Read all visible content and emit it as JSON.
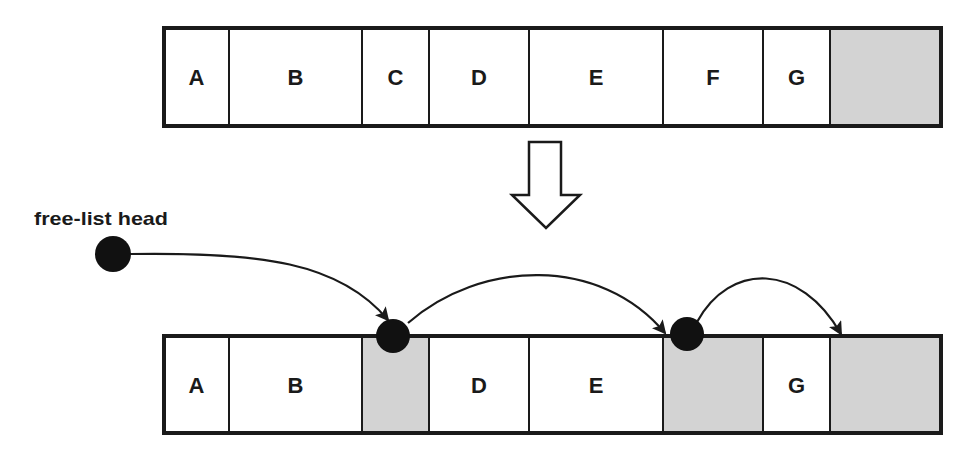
{
  "colors": {
    "stroke": "#1a1a1a",
    "free_fill": "#d3d3d3",
    "used_fill": "#ffffff",
    "node": "#111111"
  },
  "before": {
    "blocks": [
      {
        "label": "A",
        "x": 164,
        "w": 65,
        "free": false
      },
      {
        "label": "B",
        "x": 229,
        "w": 133,
        "free": false
      },
      {
        "label": "C",
        "x": 362,
        "w": 67,
        "free": false
      },
      {
        "label": "D",
        "x": 429,
        "w": 100,
        "free": false
      },
      {
        "label": "E",
        "x": 529,
        "w": 134,
        "free": false
      },
      {
        "label": "F",
        "x": 663,
        "w": 100,
        "free": false
      },
      {
        "label": "G",
        "x": 763,
        "w": 67,
        "free": false
      },
      {
        "label": "",
        "x": 830,
        "w": 111,
        "free": true
      }
    ]
  },
  "after": {
    "blocks": [
      {
        "label": "A",
        "x": 164,
        "w": 65,
        "free": false
      },
      {
        "label": "B",
        "x": 229,
        "w": 133,
        "free": false
      },
      {
        "label": "",
        "x": 362,
        "w": 67,
        "free": true
      },
      {
        "label": "D",
        "x": 429,
        "w": 100,
        "free": false
      },
      {
        "label": "E",
        "x": 529,
        "w": 134,
        "free": false
      },
      {
        "label": "",
        "x": 663,
        "w": 100,
        "free": true
      },
      {
        "label": "G",
        "x": 763,
        "w": 67,
        "free": false
      },
      {
        "label": "",
        "x": 830,
        "w": 111,
        "free": true
      }
    ]
  },
  "free_list": {
    "head_label": "free-list head"
  }
}
